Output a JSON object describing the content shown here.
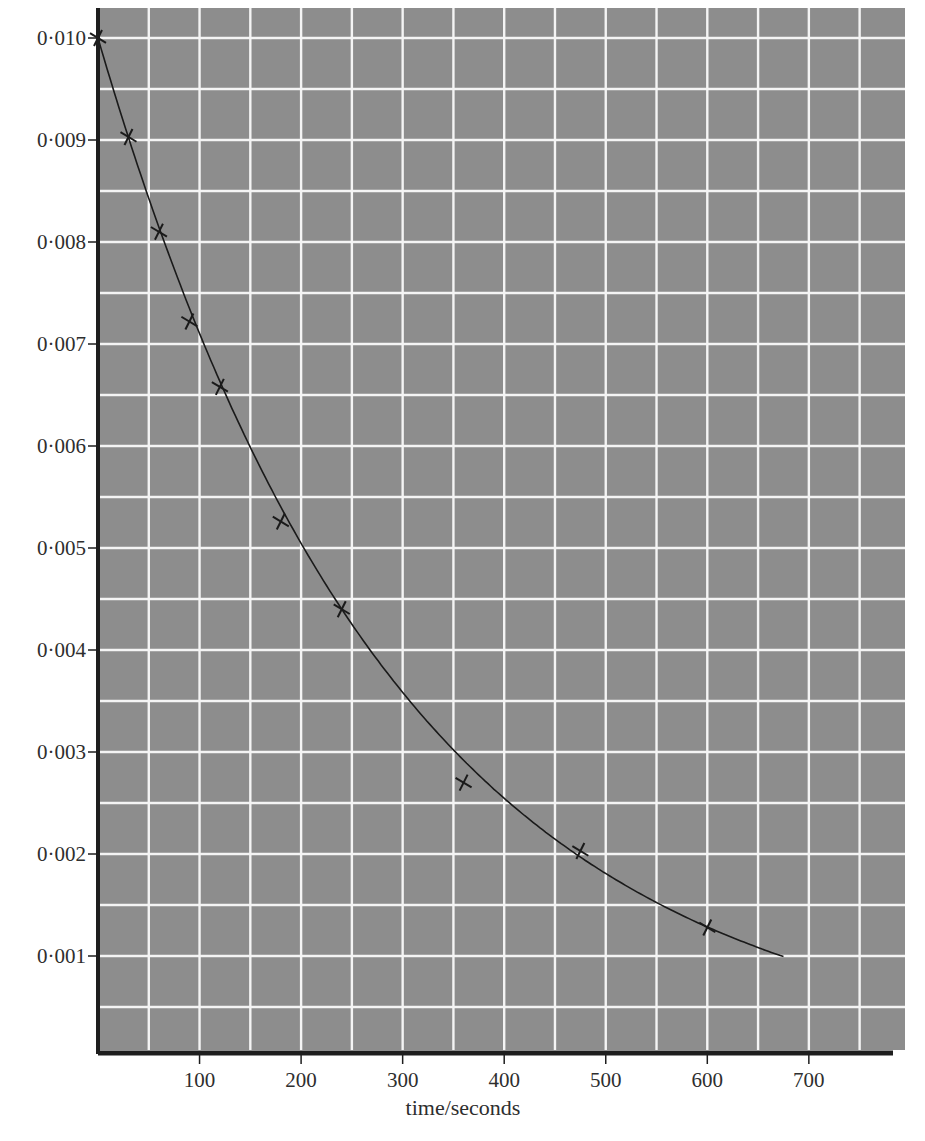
{
  "chart_data": {
    "type": "scatter",
    "title": "",
    "ylabel": "mole dm⁻³",
    "xlabel": "time/seconds",
    "xlim": [
      0,
      785
    ],
    "ylim": [
      0,
      0.0103
    ],
    "grid": true,
    "grid_spacing": {
      "x": 50,
      "y": 0.0005
    },
    "x_ticks": [
      100,
      200,
      300,
      400,
      500,
      600,
      700
    ],
    "x_tick_labels": [
      "100",
      "200",
      "300",
      "400",
      "500",
      "600",
      "700"
    ],
    "y_ticks": [
      0.001,
      0.002,
      0.003,
      0.004,
      0.005,
      0.006,
      0.007,
      0.008,
      0.009,
      0.01
    ],
    "y_tick_labels": [
      "0·001",
      "0·002",
      "0·003",
      "0·004",
      "0·005",
      "0·006",
      "0·007",
      "0·008",
      "0·009",
      "0·010"
    ],
    "legend": [],
    "series": [
      {
        "name": "measured concentration",
        "marker": "x",
        "points": [
          {
            "x": 0,
            "y": 0.01
          },
          {
            "x": 30,
            "y": 0.00903
          },
          {
            "x": 60,
            "y": 0.0081
          },
          {
            "x": 90,
            "y": 0.00722
          },
          {
            "x": 120,
            "y": 0.00658
          },
          {
            "x": 180,
            "y": 0.00526
          },
          {
            "x": 240,
            "y": 0.0044
          },
          {
            "x": 360,
            "y": 0.0027
          },
          {
            "x": 475,
            "y": 0.00203
          },
          {
            "x": 600,
            "y": 0.00128
          }
        ]
      },
      {
        "name": "fitted decay curve",
        "type": "line",
        "model": "y = 0.010 * exp(-0.00342 * x)",
        "x_range": [
          0,
          677
        ]
      }
    ]
  },
  "colors": {
    "plot_background": "#8d8d8d",
    "grid_lines": "#f4f4f4",
    "axis": "#1e1e1e",
    "curve": "#1a1a1a",
    "marker": "#1a1a1a",
    "text": "#2e2e2e"
  }
}
